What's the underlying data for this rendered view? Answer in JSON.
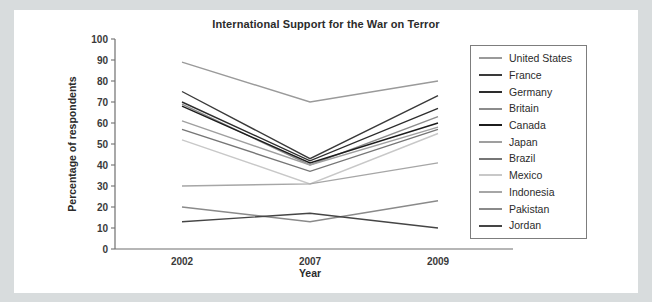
{
  "chart_data": {
    "type": "line",
    "title": "International Support for the War on Terror",
    "xlabel": "Year",
    "ylabel": "Percentage of respondents",
    "x": [
      "2002",
      "2007",
      "2009"
    ],
    "ylim": [
      0,
      100
    ],
    "yticks": [
      0,
      10,
      20,
      30,
      40,
      50,
      60,
      70,
      80,
      90,
      100
    ],
    "grid": false,
    "legend_position": "right",
    "axis_color": "#6f6f6f",
    "series": [
      {
        "name": "United States",
        "values": [
          89,
          70,
          80
        ],
        "color": "#9a9a9a"
      },
      {
        "name": "France",
        "values": [
          75,
          43,
          73
        ],
        "color": "#3a3a3a"
      },
      {
        "name": "Germany",
        "values": [
          70,
          42,
          67
        ],
        "color": "#2d2d2d"
      },
      {
        "name": "Britain",
        "values": [
          69,
          40,
          63
        ],
        "color": "#8c8c8c"
      },
      {
        "name": "Canada",
        "values": [
          68,
          41,
          60
        ],
        "color": "#1c1c1c"
      },
      {
        "name": "Japan",
        "values": [
          61,
          40,
          58
        ],
        "color": "#9f9f9f"
      },
      {
        "name": "Brazil",
        "values": [
          57,
          37,
          57
        ],
        "color": "#767676"
      },
      {
        "name": "Mexico",
        "values": [
          52,
          31,
          55
        ],
        "color": "#c8c8c8"
      },
      {
        "name": "Indonesia",
        "values": [
          30,
          31,
          41
        ],
        "color": "#a6a6a6"
      },
      {
        "name": "Pakistan",
        "values": [
          20,
          13,
          23
        ],
        "color": "#8a8a8a"
      },
      {
        "name": "Jordan",
        "values": [
          13,
          17,
          10
        ],
        "color": "#454545"
      }
    ]
  }
}
